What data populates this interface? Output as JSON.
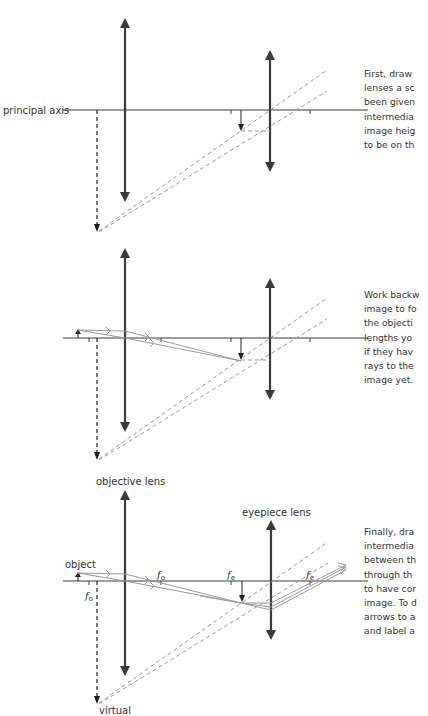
{
  "colors": {
    "axis": "#3a3a3a",
    "lens": "#3a3a3a",
    "ray": "#9a9a9a",
    "construction": "#9a9a9a",
    "text": "#333333"
  },
  "step1": {
    "axis_label": "principal axis",
    "text_lines": [
      "First, draw",
      "lenses a sc",
      "been given",
      "intermedia",
      "image heig",
      "to be on th"
    ]
  },
  "step2": {
    "text_lines": [
      "Work backw",
      "image to fo",
      "the objecti",
      "lengths yo",
      "if they hav",
      "rays to the",
      "image yet."
    ]
  },
  "step3": {
    "objective_label": "objective lens",
    "eyepiece_label": "eyepiece lens",
    "object_label": "object",
    "virtual_label": "virtual",
    "f_symbol": "f",
    "fo_sub": "o",
    "fe_sub": "e",
    "text_lines": [
      "Finally, dra",
      "intermedia",
      "between th",
      "through th",
      "to have cor",
      "image. To d",
      "arrows to a",
      "and label a"
    ]
  }
}
